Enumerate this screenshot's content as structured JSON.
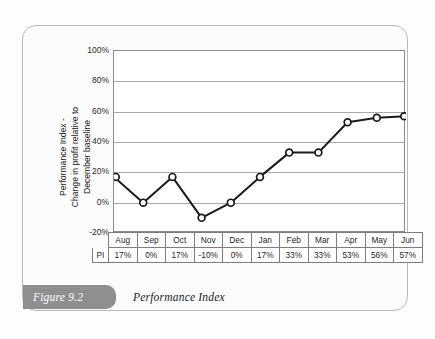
{
  "figure": {
    "tag": "Figure 9.2",
    "caption": "Performance Index"
  },
  "chart_data": {
    "type": "line",
    "title": "",
    "xlabel": "",
    "ylabel": "Performance Index - Change in profit relative to December baseline",
    "ylabel_line1": "Performance Index -",
    "ylabel_line2": "Change in profit relative to",
    "ylabel_line3": "December baseline",
    "categories": [
      "Aug",
      "Sep",
      "Oct",
      "Nov",
      "Dec",
      "Jan",
      "Feb",
      "Mar",
      "Apr",
      "May",
      "Jun"
    ],
    "values": [
      17,
      0,
      17,
      -10,
      0,
      17,
      33,
      33,
      53,
      56,
      57
    ],
    "value_labels": [
      "17%",
      "0%",
      "17%",
      "-10%",
      "0%",
      "17%",
      "33%",
      "33%",
      "53%",
      "56%",
      "57%"
    ],
    "ylim": [
      -20,
      100
    ],
    "yticks": [
      100,
      80,
      60,
      40,
      20,
      0,
      -20
    ],
    "ytick_labels": [
      "100%",
      "80%",
      "60%",
      "40%",
      "20%",
      "0%",
      "-20%"
    ],
    "grid": true,
    "legend": "none",
    "series_name": "PI",
    "marker": "open-circle",
    "line_color": "#1a1a1a",
    "marker_fill": "#ffffff",
    "grid_color": "#a9a9a9"
  },
  "table": {
    "row_label": "PI",
    "headers": [
      "Aug",
      "Sep",
      "Oct",
      "Nov",
      "Dec",
      "Jan",
      "Feb",
      "Mar",
      "Apr",
      "May",
      "Jun"
    ],
    "values": [
      "17%",
      "0%",
      "17%",
      "-10%",
      "0%",
      "17%",
      "33%",
      "33%",
      "53%",
      "56%",
      "57%"
    ]
  }
}
